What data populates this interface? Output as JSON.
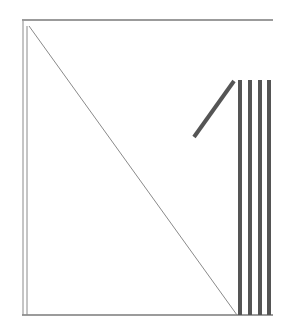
{
  "diagram": {
    "size": {
      "width": 288,
      "height": 334
    },
    "colors": {
      "background": "#ffffff",
      "thin_line": "#8a8a8a",
      "frame_line": "#7a7a7a",
      "thick_stroke": "#555555"
    },
    "frame": {
      "top_line": {
        "x1": 22,
        "y1": 20,
        "x2": 273,
        "y2": 20
      },
      "bottom_line": {
        "x1": 22,
        "y1": 315,
        "x2": 273,
        "y2": 315
      },
      "left_lines": [
        {
          "x1": 23,
          "y1": 21,
          "x2": 23,
          "y2": 315
        },
        {
          "x1": 27,
          "y1": 26,
          "x2": 27,
          "y2": 315
        }
      ]
    },
    "thin_diagonal": {
      "x1": 29,
      "y1": 26,
      "x2": 237,
      "y2": 315
    },
    "thick_diagonal": {
      "x1": 194,
      "y1": 137,
      "x2": 234,
      "y2": 81,
      "width": 4
    },
    "bars": [
      {
        "x": 238,
        "y_top": 80,
        "y_bottom": 315,
        "width": 4
      },
      {
        "x": 248,
        "y_top": 80,
        "y_bottom": 315,
        "width": 4
      },
      {
        "x": 258,
        "y_top": 80,
        "y_bottom": 315,
        "width": 4
      },
      {
        "x": 267,
        "y_top": 80,
        "y_bottom": 315,
        "width": 4
      }
    ]
  }
}
